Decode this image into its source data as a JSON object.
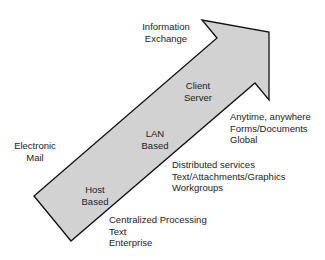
{
  "diagram": {
    "arrow": {
      "fill": "#d2d2d2",
      "stroke": "#111111",
      "stages": [
        {
          "id": "host",
          "lines": [
            "Host",
            "Based"
          ]
        },
        {
          "id": "lan",
          "lines": [
            "LAN",
            "Based"
          ]
        },
        {
          "id": "client",
          "lines": [
            "Client",
            "Server"
          ]
        }
      ]
    },
    "left_labels": [
      {
        "id": "electronic-mail",
        "lines": [
          "Electronic",
          "Mail"
        ]
      },
      {
        "id": "information-exchange",
        "lines": [
          "Information",
          "Exchange"
        ]
      }
    ],
    "right_notes": [
      {
        "id": "host-notes",
        "lines": [
          "Centralized Processing",
          "Text",
          "Enterprise"
        ]
      },
      {
        "id": "lan-notes",
        "lines": [
          "Distributed services",
          "Text/Attachments/Graphics",
          "Workgroups"
        ]
      },
      {
        "id": "client-notes",
        "lines": [
          "Anytime, anywhere",
          "Forms/Documents",
          "Global"
        ]
      }
    ]
  }
}
